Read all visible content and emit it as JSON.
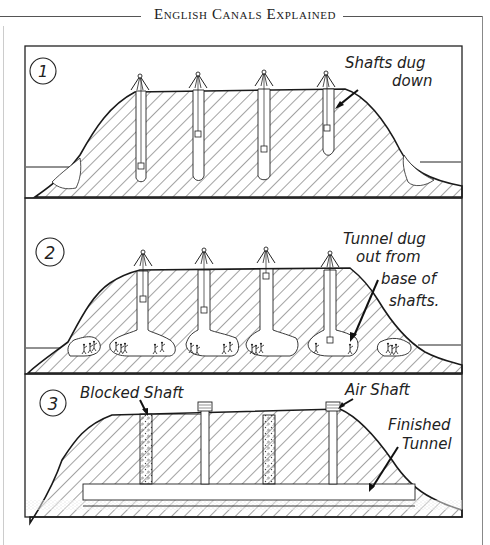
{
  "header": {
    "title": "English Canals Explained"
  },
  "diagram": {
    "panels": [
      {
        "number": "1",
        "labels": [
          {
            "line1": "Shafts dug",
            "line2": "down"
          }
        ],
        "shaft_count": 4,
        "stage": "Shafts dug down from hilltop using winches"
      },
      {
        "number": "2",
        "labels": [
          {
            "line1": "Tunnel dug",
            "line2": "out from",
            "line3": "base of",
            "line4": "shafts."
          }
        ],
        "shaft_count": 4,
        "stage": "Tunnel chambers excavated at base of each shaft"
      },
      {
        "number": "3",
        "labels": [
          {
            "text": "Blocked Shaft"
          },
          {
            "text": "Air Shaft"
          },
          {
            "line1": "Finished",
            "line2": "Tunnel"
          }
        ],
        "blocked_shafts": 2,
        "air_shafts": 2,
        "stage": "Finished tunnel with blocked and air shafts"
      }
    ]
  },
  "colors": {
    "ink": "#1a1a1a",
    "hatch": "#333333",
    "paper": "#ffffff",
    "rule": "#555555"
  }
}
